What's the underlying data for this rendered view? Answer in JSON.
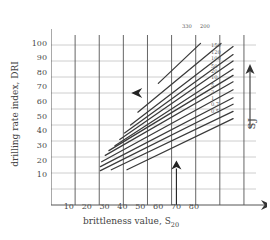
{
  "chart_data": {
    "type": "line",
    "title": "",
    "xlabel": "brittleness value, S",
    "xlabel_sub": "20",
    "ylabel": "drilling rate index, DRI",
    "xlim": [
      0,
      85
    ],
    "ylim": [
      0,
      105
    ],
    "xticks": [
      10,
      20,
      30,
      40,
      50,
      60,
      70,
      80
    ],
    "yticks": [
      10,
      20,
      30,
      40,
      50,
      60,
      70,
      80,
      90,
      100
    ],
    "grid": true,
    "legend": "none",
    "secondary_axis_label": "SJ",
    "series_parameter": "SJ",
    "series": [
      {
        "name": "330",
        "label_position": "top",
        "x": [
          44.5,
          62.0
        ],
        "values": [
          76.0,
          101.0
        ]
      },
      {
        "name": "200",
        "label_position": "top",
        "x": [
          36.0,
          70.5
        ],
        "values": [
          58.0,
          101.0
        ]
      },
      {
        "name": "150",
        "label_position": "right",
        "x": [
          33.0,
          75.5
        ],
        "values": [
          50.0,
          99.0
        ]
      },
      {
        "name": "120",
        "label_position": "right",
        "x": [
          30.5,
          75.5
        ],
        "values": [
          45.0,
          94.0
        ]
      },
      {
        "name": "100",
        "label_position": "right",
        "x": [
          28.5,
          75.5
        ],
        "values": [
          41.0,
          90.0
        ]
      },
      {
        "name": "50",
        "label_position": "right",
        "x": [
          26.5,
          75.5
        ],
        "values": [
          37.0,
          85.0
        ]
      },
      {
        "name": "20",
        "label_position": "right",
        "x": [
          24.0,
          75.5
        ],
        "values": [
          34.0,
          81.0
        ]
      },
      {
        "name": "10",
        "label_position": "right",
        "x": [
          22.5,
          75.5
        ],
        "values": [
          31.0,
          77.0
        ]
      },
      {
        "name": "5",
        "label_position": "right",
        "x": [
          21.0,
          75.5
        ],
        "values": [
          27.0,
          72.0
        ]
      },
      {
        "name": "2",
        "label_position": "right",
        "x": [
          20.5,
          75.5
        ],
        "values": [
          24.0,
          67.0
        ]
      },
      {
        "name": "1",
        "label_position": "right",
        "x": [
          20.5,
          75.5
        ],
        "values": [
          21.5,
          63.0
        ]
      },
      {
        "name": "0.7",
        "label_position": "right",
        "x": [
          25.0,
          75.5
        ],
        "values": [
          22.0,
          58.5
        ]
      },
      {
        "name": "0.5",
        "label_position": "right",
        "x": [
          31.5,
          75.5
        ],
        "values": [
          22.0,
          54.0
        ]
      }
    ],
    "annotations": [
      {
        "name": "left-arrow-marker",
        "kind": "arrow",
        "direction": "left",
        "x": 37.0,
        "y": 70.0
      },
      {
        "name": "up-arrow-marker",
        "kind": "arrow",
        "direction": "up",
        "x": 52.0,
        "y": 24.0
      }
    ],
    "axis_arrows": {
      "x": "right",
      "y": "up"
    }
  },
  "axes": {
    "y_label": "drilling rate index, DRI",
    "x_label_main": "brittleness value, S",
    "x_label_sub": "20",
    "right_label": "SJ"
  },
  "ticks": {
    "y": [
      "100",
      "90",
      "80",
      "70",
      "60",
      "50",
      "40",
      "30",
      "20",
      "10"
    ],
    "x": [
      "10",
      "20",
      "30",
      "40",
      "50",
      "60",
      "70",
      "80"
    ]
  },
  "curve_labels": {
    "top": [
      "330",
      "200"
    ],
    "right": [
      "150",
      "120",
      "100",
      "50",
      "20",
      "10",
      "5",
      "2",
      "1",
      "0.7",
      "0.5"
    ]
  },
  "colors": {
    "background": "#ffffff",
    "grid_minor": "#c8c8c8",
    "grid_major": "#555555",
    "curve": "#3a3a3a",
    "text": "#444444"
  }
}
